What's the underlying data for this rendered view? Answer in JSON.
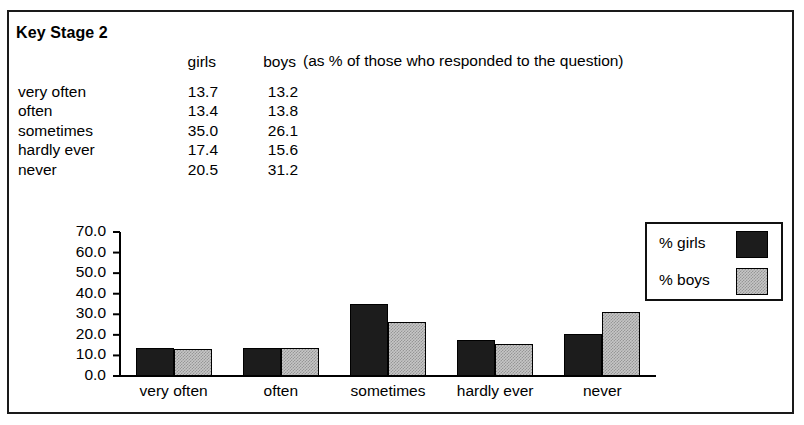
{
  "document": {
    "title": "Key Stage 2",
    "annotation": "(as % of those who responded to the question)"
  },
  "table": {
    "columns": [
      "",
      "girls",
      "boys"
    ],
    "rows": [
      {
        "label": "very often",
        "girls": "13.7",
        "boys": "13.2"
      },
      {
        "label": "often",
        "girls": "13.4",
        "boys": "13.8"
      },
      {
        "label": "sometimes",
        "girls": "35.0",
        "boys": "26.1"
      },
      {
        "label": "hardly ever",
        "girls": "17.4",
        "boys": "15.6"
      },
      {
        "label": "never",
        "girls": "20.5",
        "boys": "31.2"
      }
    ]
  },
  "legend": {
    "items": [
      {
        "label": "% girls",
        "color": "#1c1c1c"
      },
      {
        "label": "% boys",
        "color": "#c6c6c6"
      }
    ]
  },
  "chart_data": {
    "type": "bar",
    "title": "Key Stage 2",
    "xlabel": "",
    "ylabel": "",
    "categories": [
      "very often",
      "often",
      "sometimes",
      "hardly ever",
      "never"
    ],
    "series": [
      {
        "name": "% girls",
        "color": "#1c1c1c",
        "values": [
          13.7,
          13.4,
          35.0,
          17.4,
          20.5
        ]
      },
      {
        "name": "% boys",
        "color": "#c6c6c6",
        "values": [
          13.2,
          13.8,
          26.1,
          15.6,
          31.2
        ]
      }
    ],
    "ylim": [
      0.0,
      70.0
    ],
    "yticks": [
      "0.0",
      "10.0",
      "20.0",
      "30.0",
      "40.0",
      "50.0",
      "60.0",
      "70.0"
    ],
    "ytick_values": [
      0.0,
      10.0,
      20.0,
      30.0,
      40.0,
      50.0,
      60.0,
      70.0
    ],
    "grid": false,
    "legend_position": "right"
  }
}
